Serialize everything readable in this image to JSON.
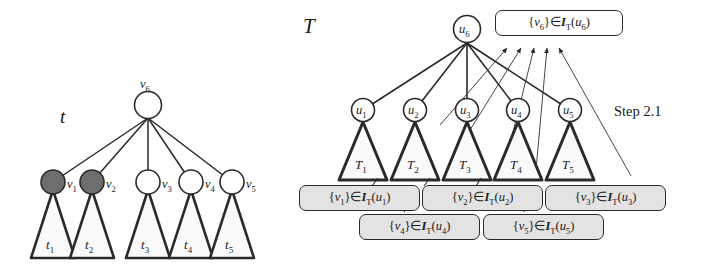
{
  "figure": {
    "caption_label": "Step 2.1",
    "left_tree": {
      "name": "t",
      "root": {
        "id": "v6",
        "label": "v",
        "sub": "6"
      },
      "children": [
        {
          "id": "v1",
          "label": "v",
          "sub": "1",
          "shaded": true,
          "subtree": {
            "label": "t",
            "sub": "1"
          }
        },
        {
          "id": "v2",
          "label": "v",
          "sub": "2",
          "shaded": true,
          "subtree": {
            "label": "t",
            "sub": "2"
          }
        },
        {
          "id": "v3",
          "label": "v",
          "sub": "3",
          "shaded": false,
          "subtree": {
            "label": "t",
            "sub": "3"
          }
        },
        {
          "id": "v4",
          "label": "v",
          "sub": "4",
          "shaded": false,
          "subtree": {
            "label": "t",
            "sub": "4"
          }
        },
        {
          "id": "v5",
          "label": "v",
          "sub": "5",
          "shaded": false,
          "subtree": {
            "label": "t",
            "sub": "5"
          }
        }
      ]
    },
    "right_tree": {
      "name": "T",
      "root": {
        "id": "u6",
        "label": "u",
        "sub": "6"
      },
      "children": [
        {
          "id": "u1",
          "label": "u",
          "sub": "1",
          "subtree": {
            "label": "T",
            "sub": "1"
          }
        },
        {
          "id": "u2",
          "label": "u",
          "sub": "2",
          "subtree": {
            "label": "T",
            "sub": "2"
          }
        },
        {
          "id": "u3",
          "label": "u",
          "sub": "3",
          "subtree": {
            "label": "T",
            "sub": "3"
          }
        },
        {
          "id": "u4",
          "label": "u",
          "sub": "4",
          "subtree": {
            "label": "T",
            "sub": "4"
          }
        },
        {
          "id": "u5",
          "label": "u",
          "sub": "5",
          "subtree": {
            "label": "T",
            "sub": "5"
          }
        }
      ]
    },
    "callouts": [
      {
        "id": "c6",
        "elem": "v",
        "elem_sub": "6",
        "op": "∈",
        "fn": "I",
        "fn_sub": "T",
        "arg": "u",
        "arg_sub": "6",
        "style": "plain"
      },
      {
        "id": "c1",
        "elem": "v",
        "elem_sub": "1",
        "op": "∈",
        "fn": "I",
        "fn_sub": "T",
        "arg": "u",
        "arg_sub": "1",
        "style": "shaded"
      },
      {
        "id": "c2",
        "elem": "v",
        "elem_sub": "2",
        "op": "∈",
        "fn": "I",
        "fn_sub": "T",
        "arg": "u",
        "arg_sub": "2",
        "style": "shaded"
      },
      {
        "id": "c3",
        "elem": "v",
        "elem_sub": "3",
        "op": "∈",
        "fn": "I",
        "fn_sub": "T",
        "arg": "u",
        "arg_sub": "3",
        "style": "shaded"
      },
      {
        "id": "c4",
        "elem": "v",
        "elem_sub": "4",
        "op": "∈",
        "fn": "I",
        "fn_sub": "T",
        "arg": "u",
        "arg_sub": "4",
        "style": "shaded"
      },
      {
        "id": "c5",
        "elem": "v",
        "elem_sub": "5",
        "op": "∈",
        "fn": "I",
        "fn_sub": "T",
        "arg": "u",
        "arg_sub": "5",
        "style": "shaded"
      }
    ],
    "colors": {
      "stroke": "#2a2a2a",
      "node_fill": "#ffffff",
      "shaded_node_fill": "#6e6e6e",
      "triangle_fill": "#fafafa",
      "callout_fill": "#e3e3e3",
      "background": "#ffffff"
    }
  }
}
